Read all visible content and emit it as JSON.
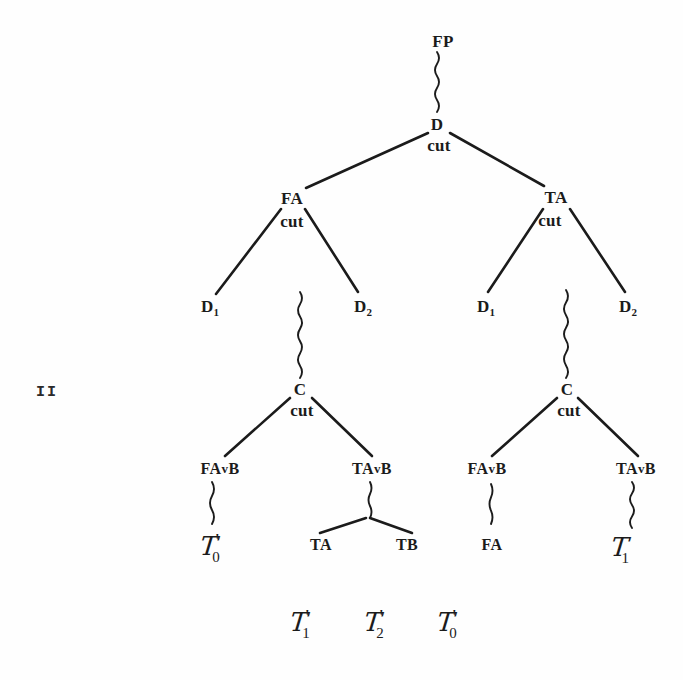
{
  "figure": {
    "side_label": "II",
    "cut_label": "cut",
    "vee": "v",
    "prime": "'"
  },
  "nodes": {
    "root": {
      "label": "FP",
      "x": 443,
      "y": 41
    },
    "d_root": {
      "label": "D",
      "x": 437,
      "y": 124,
      "cut_x": 439,
      "cut_y": 146
    },
    "fa_left": {
      "label": "FA",
      "x": 292,
      "y": 198,
      "cut_x": 292,
      "cut_y": 222
    },
    "ta_right": {
      "label": "TA",
      "x": 556,
      "y": 197,
      "cut_x": 550,
      "cut_y": 221
    },
    "d1_left": {
      "base": "D",
      "sub": "1",
      "x": 210,
      "y": 308
    },
    "d2_left": {
      "base": "D",
      "sub": "2",
      "x": 363,
      "y": 308
    },
    "d1_right": {
      "base": "D",
      "sub": "1",
      "x": 486,
      "y": 308
    },
    "d2_right": {
      "base": "D",
      "sub": "2",
      "x": 628,
      "y": 308
    },
    "c_left": {
      "label": "C",
      "x": 300,
      "y": 389,
      "cut_x": 302,
      "cut_y": 411
    },
    "c_right": {
      "label": "C",
      "x": 567,
      "y": 389,
      "cut_x": 569,
      "cut_y": 411
    },
    "favb_1": {
      "base": "FA",
      "rest": "B",
      "x": 220,
      "y": 469
    },
    "tavb_1": {
      "base": "TA",
      "rest": "B",
      "x": 372,
      "y": 469
    },
    "favb_2": {
      "base": "FA",
      "rest": "B",
      "x": 487,
      "y": 469
    },
    "tavb_2": {
      "base": "TA",
      "rest": "B",
      "x": 636,
      "y": 469
    },
    "ta_leaf": {
      "label": "TA",
      "x": 321,
      "y": 545
    },
    "tb_leaf": {
      "label": "TB",
      "x": 407,
      "y": 545
    },
    "fa_leaf": {
      "label": "FA",
      "x": 492,
      "y": 545
    }
  },
  "script_symbols": [
    {
      "name": "tau-0-prime-left",
      "base": "T",
      "prime": "'",
      "sub": "0",
      "x": 210,
      "y": 548
    },
    {
      "name": "tau-1-right",
      "base": "T",
      "prime": "",
      "sub": "1",
      "x": 620,
      "y": 549
    },
    {
      "name": "tau-1-prime-bottom",
      "base": "T",
      "prime": "'",
      "sub": "1",
      "x": 300,
      "y": 624
    },
    {
      "name": "tau-2-prime-bottom",
      "base": "T",
      "prime": "'",
      "sub": "2",
      "x": 374,
      "y": 624
    },
    {
      "name": "tau-0-prime-bottom",
      "base": "T",
      "prime": "'",
      "sub": "0",
      "x": 447,
      "y": 624
    }
  ],
  "edges": [
    {
      "name": "edge-d-to-fa",
      "x1": 428,
      "y1": 133,
      "x2": 306,
      "y2": 188
    },
    {
      "name": "edge-d-to-ta",
      "x1": 450,
      "y1": 133,
      "x2": 544,
      "y2": 186
    },
    {
      "name": "edge-fa-to-d1",
      "x1": 281,
      "y1": 209,
      "x2": 216,
      "y2": 294
    },
    {
      "name": "edge-fa-to-d2",
      "x1": 305,
      "y1": 209,
      "x2": 358,
      "y2": 292
    },
    {
      "name": "edge-ta-to-d1",
      "x1": 543,
      "y1": 209,
      "x2": 488,
      "y2": 292
    },
    {
      "name": "edge-ta-to-d2",
      "x1": 570,
      "y1": 209,
      "x2": 625,
      "y2": 292
    },
    {
      "name": "edge-c-to-favb-1",
      "x1": 290,
      "y1": 398,
      "x2": 225,
      "y2": 456
    },
    {
      "name": "edge-c-to-tavb-1",
      "x1": 312,
      "y1": 398,
      "x2": 372,
      "y2": 456
    },
    {
      "name": "edge-c-to-favb-2",
      "x1": 557,
      "y1": 398,
      "x2": 492,
      "y2": 456
    },
    {
      "name": "edge-c-to-tavb-2",
      "x1": 578,
      "y1": 398,
      "x2": 638,
      "y2": 456
    },
    {
      "name": "edge-tavb-to-ta",
      "x1": 366,
      "y1": 518,
      "x2": 320,
      "y2": 533
    },
    {
      "name": "edge-tavb-to-tb",
      "x1": 370,
      "y1": 518,
      "x2": 412,
      "y2": 533
    }
  ],
  "squiggles": [
    {
      "name": "squiggle-fp-to-d",
      "x": 437,
      "y1": 52,
      "y2": 112,
      "amp": 4
    },
    {
      "name": "squiggle-d2-left-to-c",
      "x": 300,
      "y1": 292,
      "y2": 378,
      "amp": 4
    },
    {
      "name": "squiggle-d-right-to-c",
      "x": 566,
      "y1": 290,
      "y2": 378,
      "amp": 4
    },
    {
      "name": "squiggle-favb1-to-tau",
      "x": 212,
      "y1": 482,
      "y2": 524,
      "amp": 4
    },
    {
      "name": "squiggle-tavb1-to-fork",
      "x": 370,
      "y1": 482,
      "y2": 518,
      "amp": 3
    },
    {
      "name": "squiggle-favb2-to-fa",
      "x": 491,
      "y1": 484,
      "y2": 524,
      "amp": 3
    },
    {
      "name": "squiggle-tavb2-to-tau",
      "x": 632,
      "y1": 482,
      "y2": 528,
      "amp": 4
    }
  ]
}
